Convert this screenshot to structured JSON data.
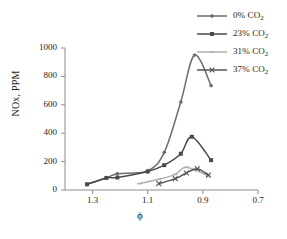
{
  "figure": {
    "background": "#ffffff"
  },
  "chart_data": {
    "type": "line",
    "title": "",
    "xlabel": "ϕ",
    "ylabel": "NOx, PPM",
    "xlim": [
      1.4,
      0.7
    ],
    "ylim": [
      0,
      1000
    ],
    "x_ticks": [
      "1.3",
      "1.1",
      "0.9",
      "0.7"
    ],
    "x_tick_values": [
      1.3,
      1.1,
      0.9,
      0.7
    ],
    "y_ticks": [
      "0",
      "200",
      "400",
      "600",
      "800",
      "1000"
    ],
    "y_tick_values": [
      0,
      200,
      400,
      600,
      800,
      1000
    ],
    "x_axis_reversed": true,
    "grid": false,
    "legend_position": "upper-right-outside",
    "series": [
      {
        "name": "0% CO2",
        "label_main": "0%",
        "label_gas": "CO",
        "label_sub": "2",
        "color": "#6d6d6d",
        "marker": "diamond",
        "x": [
          1.32,
          1.25,
          1.21,
          1.1,
          1.04,
          0.98,
          0.93,
          0.87
        ],
        "y": [
          40,
          85,
          115,
          135,
          265,
          620,
          950,
          735
        ]
      },
      {
        "name": "23% CO2",
        "label_main": "23%",
        "label_gas": "CO",
        "label_sub": "2",
        "color": "#4a4a4a",
        "marker": "square",
        "x": [
          1.32,
          1.25,
          1.21,
          1.1,
          1.04,
          0.98,
          0.94,
          0.87
        ],
        "y": [
          40,
          85,
          88,
          130,
          175,
          255,
          375,
          210
        ]
      },
      {
        "name": "31% CO2",
        "label_main": "31%",
        "label_gas": "CO",
        "label_sub": "2",
        "color": "#b0b0b0",
        "marker": "tick",
        "x": [
          1.13,
          1.06,
          1.0,
          0.96,
          0.88
        ],
        "y": [
          45,
          75,
          110,
          160,
          100
        ]
      },
      {
        "name": "37% CO2",
        "label_main": "37%",
        "label_gas": "CO",
        "label_sub": "2",
        "color": "#555555",
        "marker": "cross",
        "x": [
          1.06,
          1.0,
          0.96,
          0.92,
          0.88
        ],
        "y": [
          45,
          80,
          120,
          150,
          105
        ]
      }
    ]
  }
}
